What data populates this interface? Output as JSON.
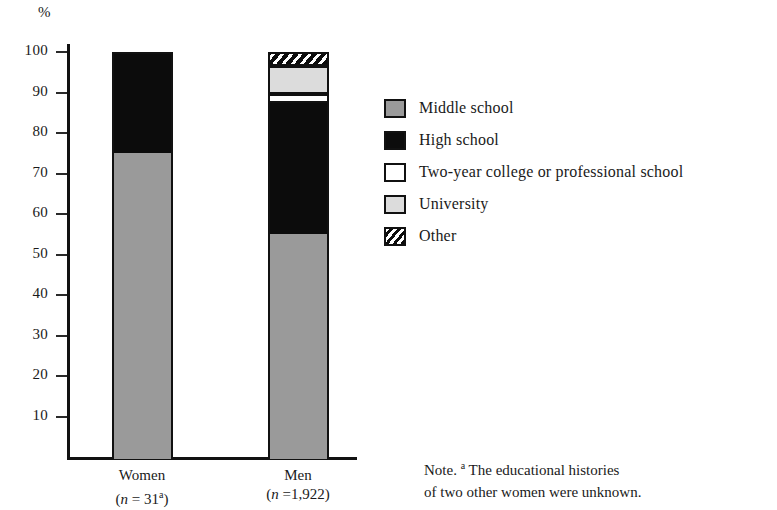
{
  "axis": {
    "unit_label": "%",
    "tick_labels": [
      "100",
      "90",
      "80",
      "70",
      "60",
      "50",
      "40",
      "30",
      "20",
      "10"
    ],
    "ticks": [
      100,
      90,
      80,
      70,
      60,
      50,
      40,
      30,
      20,
      10
    ],
    "ymin": 0,
    "ymax": 100
  },
  "categories": [
    {
      "name": "Women",
      "n_line": "(n = 31",
      "n_sup": "a",
      "n_close": ")"
    },
    {
      "name": "Men",
      "n_line": "(n =1,922",
      "n_sup": "",
      "n_close": ")"
    }
  ],
  "legend": {
    "items": [
      {
        "label": "Middle school",
        "swatch": "solid-gray",
        "color": "#9a9a9a"
      },
      {
        "label": "High school",
        "swatch": "solid-black",
        "color": "#0c0c0c"
      },
      {
        "label": "Two-year college or professional school",
        "swatch": "solid-white",
        "color": "#ffffff"
      },
      {
        "label": "University",
        "swatch": "solid-light-gray",
        "color": "#dcdcdc"
      },
      {
        "label": "Other",
        "swatch": "diagonal-hatch",
        "color": "#0c0c0c"
      }
    ]
  },
  "note": {
    "prefix": "Note. ",
    "sup": "a",
    "text_line1": " The educational histories",
    "text_line2": "of two other women were unknown."
  },
  "chart_data": {
    "type": "bar",
    "stacked": true,
    "title": "",
    "xlabel": "",
    "ylabel": "%",
    "ylim": [
      0,
      100
    ],
    "yticks": [
      10,
      20,
      30,
      40,
      50,
      60,
      70,
      80,
      90,
      100
    ],
    "grid": false,
    "legend_position": "right",
    "categories": [
      "Women",
      "Men"
    ],
    "series": [
      {
        "name": "Middle school",
        "color": "#9a9a9a",
        "values": [
          75.5,
          55.5
        ]
      },
      {
        "name": "High school",
        "color": "#0c0c0c",
        "values": [
          24.5,
          32.5
        ]
      },
      {
        "name": "Two-year college or professional school",
        "color": "#ffffff",
        "values": [
          0,
          2.0
        ]
      },
      {
        "name": "University",
        "color": "#dcdcdc",
        "values": [
          0,
          7.0
        ]
      },
      {
        "name": "Other",
        "color": "#0c0c0c",
        "values": [
          0,
          3.0
        ]
      }
    ],
    "sample_sizes": {
      "Women": 31,
      "Men": 1922
    }
  }
}
